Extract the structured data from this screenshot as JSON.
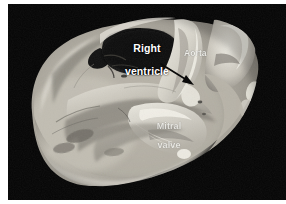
{
  "figure": {
    "kind": "anatomical-photograph",
    "background_color": "#050505",
    "page_color": "#ffffff",
    "plate": {
      "left": 8,
      "top": 4,
      "width": 278,
      "height": 196
    }
  },
  "labels": {
    "right_ventricle": {
      "line1": "Right",
      "line2": "ventricle",
      "color": "#ffffff"
    },
    "aorta": {
      "text": "Aorta",
      "color": "#f2f2ee"
    },
    "mitral_valve": {
      "line1": "Mitral",
      "line2": "valve",
      "color": "#f6f6f2"
    }
  },
  "annotations": {
    "arrow": {
      "name": "pointer-arrow",
      "color": "#0a0a0a",
      "from_x": 161,
      "from_y": 68,
      "to_x": 190,
      "to_y": 85
    }
  },
  "palette": {
    "background": "#050505",
    "tissue_light": "#d9d6cd",
    "tissue_mid": "#a9a59a",
    "tissue_dark": "#6f6b62",
    "cavity_dark": "#101010",
    "highlight": "#f0eee6",
    "label_white": "#ffffff",
    "arrow_black": "#0a0a0a"
  }
}
